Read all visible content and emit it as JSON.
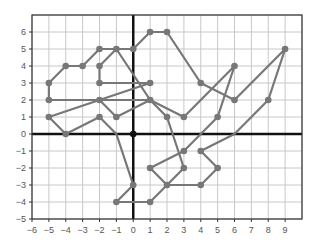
{
  "chart_data": {
    "type": "line",
    "title": "",
    "xlabel": "",
    "ylabel": "",
    "xlim": [
      -6,
      10
    ],
    "ylim": [
      -5,
      7
    ],
    "grid": true,
    "x_ticks": [
      -6,
      -5,
      -4,
      -3,
      -2,
      -1,
      0,
      1,
      2,
      3,
      4,
      5,
      6,
      7,
      8,
      9
    ],
    "y_ticks": [
      -5,
      -4,
      -3,
      -2,
      -1,
      0,
      1,
      2,
      3,
      4,
      5,
      6
    ],
    "origin_point": [
      0,
      0
    ],
    "line_color": "#777777",
    "axis_color": "#111111",
    "grid_color": "#c8c8c8",
    "segments": [
      [
        [
          -5,
          2
        ],
        [
          -5,
          3
        ],
        [
          -4,
          4
        ],
        [
          -3,
          4
        ],
        [
          -2,
          5
        ],
        [
          -1,
          5
        ],
        [
          1,
          2
        ]
      ],
      [
        [
          -2,
          3
        ],
        [
          -2,
          4
        ],
        [
          -1,
          5
        ]
      ],
      [
        [
          -2,
          3
        ],
        [
          1,
          3
        ]
      ],
      [
        [
          -5,
          2
        ],
        [
          -2,
          2
        ],
        [
          -1,
          1
        ],
        [
          1,
          2
        ],
        [
          2,
          1
        ],
        [
          3,
          -2
        ],
        [
          2,
          -3
        ]
      ],
      [
        [
          -5,
          1
        ],
        [
          1,
          3
        ]
      ],
      [
        [
          -5,
          1
        ],
        [
          -4,
          0
        ],
        [
          -2,
          1
        ],
        [
          -1,
          0
        ],
        [
          0,
          -3
        ],
        [
          -1,
          -4
        ],
        [
          1,
          -4
        ],
        [
          2,
          -3
        ],
        [
          4,
          -3
        ],
        [
          5,
          -2
        ],
        [
          4,
          -1
        ],
        [
          6,
          0
        ],
        [
          8,
          2
        ],
        [
          9,
          5
        ],
        [
          6,
          2
        ],
        [
          4,
          3
        ],
        [
          2,
          6
        ],
        [
          1,
          6
        ],
        [
          0,
          5
        ],
        [
          -1,
          5
        ]
      ],
      [
        [
          1,
          2
        ],
        [
          3,
          1
        ],
        [
          6,
          4
        ],
        [
          5,
          1
        ],
        [
          3,
          -1
        ],
        [
          1,
          -2
        ],
        [
          2,
          -3
        ]
      ],
      [
        [
          -2,
          2
        ],
        [
          1,
          2
        ]
      ]
    ],
    "points": [
      [
        -5,
        3
      ],
      [
        -5,
        2
      ],
      [
        -5,
        1
      ],
      [
        -4,
        4
      ],
      [
        -3,
        4
      ],
      [
        -2,
        5
      ],
      [
        -1,
        5
      ],
      [
        0,
        5
      ],
      [
        1,
        6
      ],
      [
        2,
        6
      ],
      [
        -2,
        4
      ],
      [
        -2,
        3
      ],
      [
        1,
        3
      ],
      [
        -2,
        2
      ],
      [
        -2,
        1
      ],
      [
        -1,
        1
      ],
      [
        1,
        2
      ],
      [
        2,
        1
      ],
      [
        3,
        1
      ],
      [
        4,
        3
      ],
      [
        6,
        2
      ],
      [
        9,
        5
      ],
      [
        8,
        2
      ],
      [
        6,
        4
      ],
      [
        5,
        1
      ],
      [
        3,
        -1
      ],
      [
        4,
        -1
      ],
      [
        5,
        -2
      ],
      [
        4,
        -3
      ],
      [
        3,
        -2
      ],
      [
        2,
        -3
      ],
      [
        1,
        -2
      ],
      [
        0,
        -3
      ],
      [
        -1,
        -4
      ],
      [
        1,
        -4
      ],
      [
        -4,
        0
      ]
    ]
  }
}
